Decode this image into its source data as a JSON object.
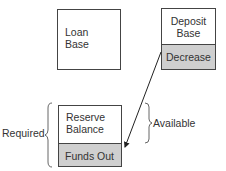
{
  "diagram": {
    "loan_box": {
      "line1": "Loan",
      "line2": "Base"
    },
    "deposit_box": {
      "line1": "Deposit",
      "line2": "Base",
      "shaded_label": "Decrease"
    },
    "reserve_box": {
      "line1": "Reserve",
      "line2": "Balance",
      "shaded_label": "Funds Out"
    },
    "brace_left_label": "Required",
    "brace_right_label": "Available",
    "colors": {
      "shaded": "#cfcfcf",
      "border": "#444444",
      "text": "#333333"
    }
  }
}
